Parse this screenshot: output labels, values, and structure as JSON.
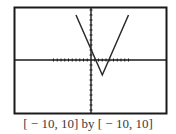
{
  "caption": "[ − 10, 10] by [ − 10, 10]",
  "colors": {
    "frame": "#1a1a1a",
    "axes": "#1a1a1a",
    "curve": "#2a2a2a",
    "caption": "#3a3a3a",
    "background": "#ffffff"
  },
  "chart_data": {
    "type": "line",
    "title": "",
    "xlabel": "",
    "ylabel": "",
    "xlim": [
      -10,
      10
    ],
    "ylim": [
      -10,
      10
    ],
    "window_caption": "[-10, 10] by [-10, 10]",
    "grid": false,
    "tick_spacing": 1,
    "series": [
      {
        "name": "y = |2x - 6| - 3 (approx.)",
        "x": [
          -4,
          3,
          10
        ],
        "y": [
          9,
          -3,
          9
        ]
      }
    ],
    "key_points": {
      "vertex": [
        3,
        -3
      ],
      "y_intercept": [
        0,
        3
      ],
      "x_intercepts": [
        1.5,
        4.5
      ]
    }
  }
}
